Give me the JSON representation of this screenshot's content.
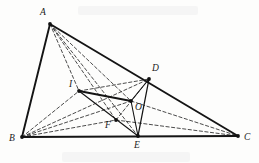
{
  "figure": {
    "background_color": "#fdfdfc",
    "stroke_color": "#1a1a1a",
    "points": [
      {
        "id": "A",
        "label": "A",
        "x": 50,
        "y": 24,
        "label_x": 40,
        "label_y": 8,
        "dot": true
      },
      {
        "id": "B",
        "label": "B",
        "x": 22,
        "y": 137,
        "label_x": 9,
        "label_y": 134,
        "dot": true
      },
      {
        "id": "C",
        "label": "C",
        "x": 238,
        "y": 136,
        "label_x": 244,
        "label_y": 133,
        "dot": true
      },
      {
        "id": "D",
        "label": "D",
        "x": 149,
        "y": 79,
        "label_x": 152,
        "label_y": 64,
        "dot": true
      },
      {
        "id": "E",
        "label": "E",
        "x": 138,
        "y": 136,
        "label_x": 134,
        "label_y": 141,
        "dot": true
      },
      {
        "id": "I",
        "label": "I",
        "x": 79,
        "y": 91,
        "label_x": 69,
        "label_y": 80,
        "dot": true
      },
      {
        "id": "O",
        "label": "O",
        "x": 131,
        "y": 101,
        "label_x": 135,
        "label_y": 103,
        "dot": true
      },
      {
        "id": "F",
        "label": "F",
        "x": 116,
        "y": 120,
        "label_x": 105,
        "label_y": 121,
        "dot": true
      }
    ],
    "solid_segments": [
      {
        "name": "side-AB",
        "from": "A",
        "to": "B",
        "width": 1.9
      },
      {
        "name": "side-AC",
        "from": "A",
        "to": "C",
        "width": 1.9
      },
      {
        "name": "side-BC",
        "from": "B",
        "to": "C",
        "width": 1.9
      },
      {
        "name": "segment-DE",
        "from": "D",
        "to": "E",
        "width": 1.3
      },
      {
        "name": "segment-IO",
        "from": "I",
        "to": "O",
        "width": 1.9
      },
      {
        "name": "segment-IE",
        "from": "I",
        "to": "E",
        "width": 1.1
      },
      {
        "name": "segment-OD",
        "from": "O",
        "to": "D",
        "width": 1.1
      },
      {
        "name": "segment-OE",
        "from": "O",
        "to": "E",
        "width": 1.1
      }
    ],
    "dashed_segments": [
      {
        "name": "segment-AI",
        "from": "A",
        "to": "I"
      },
      {
        "name": "segment-AO",
        "from": "A",
        "to": "O"
      },
      {
        "name": "segment-AF",
        "from": "A",
        "to": "F"
      },
      {
        "name": "segment-AE",
        "from": "A",
        "to": "E"
      },
      {
        "name": "segment-BI",
        "from": "B",
        "to": "I"
      },
      {
        "name": "segment-BO",
        "from": "B",
        "to": "O"
      },
      {
        "name": "segment-BD",
        "from": "B",
        "to": "D"
      },
      {
        "name": "segment-BF",
        "from": "B",
        "to": "F"
      },
      {
        "name": "segment-FC",
        "from": "F",
        "to": "C"
      },
      {
        "name": "segment-ID",
        "from": "I",
        "to": "D"
      },
      {
        "name": "segment-OC",
        "from": "O",
        "to": "C"
      },
      {
        "name": "segment-FD",
        "from": "F",
        "to": "D"
      }
    ]
  }
}
